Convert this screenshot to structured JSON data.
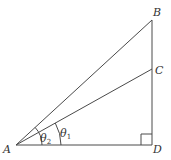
{
  "diagram": {
    "type": "right-triangle-geometry",
    "points": {
      "A": {
        "label": "A",
        "x": 16,
        "y": 145
      },
      "B": {
        "label": "B",
        "x": 152,
        "y": 20
      },
      "C": {
        "label": "C",
        "x": 152,
        "y": 69
      },
      "D": {
        "label": "D",
        "x": 152,
        "y": 145
      }
    },
    "segments": [
      "AB",
      "AC",
      "AD",
      "BD"
    ],
    "right_angle_at": "D",
    "angles": [
      {
        "name": "theta2",
        "symbol": "θ",
        "subscript": "2",
        "between": [
          "AD",
          "AB"
        ]
      },
      {
        "name": "theta1",
        "symbol": "θ",
        "subscript": "1",
        "between": [
          "AD",
          "AC"
        ]
      }
    ],
    "colors": {
      "line": "#4a4a4a",
      "text": "#333333",
      "background": "#ffffff"
    }
  }
}
